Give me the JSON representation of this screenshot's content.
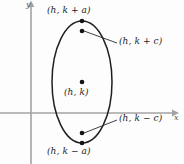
{
  "figure": {
    "axes": {
      "x_label": "x",
      "y_label": "y",
      "axis_color": "#a0a0a0",
      "x_axis_y": 113,
      "y_axis_x": 31
    },
    "curve": {
      "shape": "ellipse",
      "stroke_color": "#1f1f1f",
      "center_x": 82,
      "center_y": 82,
      "radius_x": 30,
      "radius_y": 61
    },
    "points": [
      {
        "name": "vertex-top",
        "label": "(h, k + a)",
        "x": 82,
        "y": 21
      },
      {
        "name": "focus-top",
        "label": "(h, k + c)",
        "x": 82,
        "y": 31
      },
      {
        "name": "center",
        "label": "(h, k)",
        "x": 82,
        "y": 82
      },
      {
        "name": "focus-bottom",
        "label": "(h, k − c)",
        "x": 82,
        "y": 133
      },
      {
        "name": "vertex-bottom",
        "label": "(h, k − a)",
        "x": 82,
        "y": 143
      }
    ],
    "leader_lines": [
      {
        "name": "leader-focus-top",
        "x1": 84,
        "y1": 31,
        "x2": 117,
        "y2": 43
      },
      {
        "name": "leader-focus-bottom",
        "x1": 84,
        "y1": 133,
        "x2": 117,
        "y2": 120
      }
    ],
    "dot_color": "#141414"
  }
}
